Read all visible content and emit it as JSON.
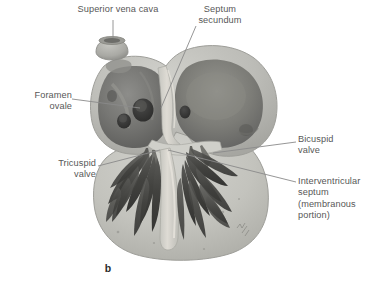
{
  "figure": {
    "caption": "b",
    "background_color": "#ffffff",
    "label_color": "#575757",
    "leader_color": "#8a8a8a",
    "caption_color": "#2b2b2b"
  },
  "labels": {
    "superior_vena_cava": "Superior vena cava",
    "septum_secundum": "Septum\nsecundum",
    "foramen_ovale": "Foramen\novale",
    "tricuspid_valve": "Tricuspid\nvalve",
    "bicuspid_valve": "Bicuspid\nvalve",
    "interventricular_septum": "Interventricular\nseptum\n(membranous\nportion)"
  },
  "anatomy": {
    "myocardium_color": "#b8b8b4",
    "atrium_cavity_color": "#6e6e6e",
    "ventricle_color": "#c2c2be",
    "trabeculae_color": "#4a4a4a",
    "septum_color": "#d2d2ce",
    "opening_color": "#3a3a3a",
    "parts": [
      "superior vena cava stub",
      "right atrium",
      "left atrium",
      "septum secundum",
      "foramen ovale",
      "tricuspid valve",
      "bicuspid valve",
      "interventricular septum",
      "right ventricle trabeculae",
      "left ventricle trabeculae"
    ]
  }
}
